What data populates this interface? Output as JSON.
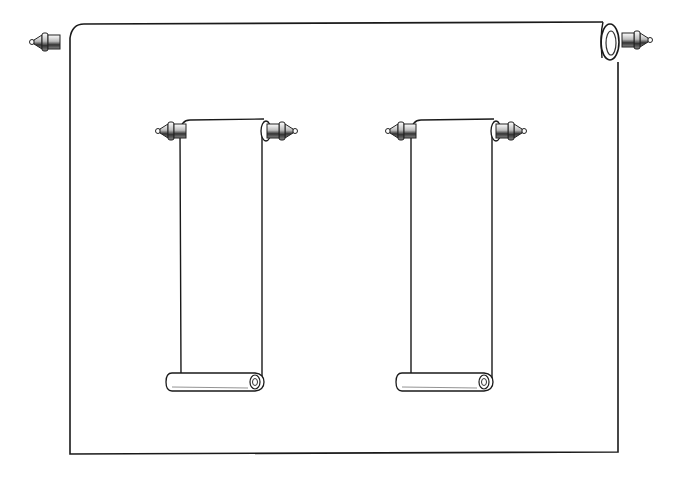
{
  "illustration": {
    "description": "Line-art engraving of a large hanging scroll with two smaller hanging scrolls inside",
    "colors": {
      "background": "#ffffff",
      "line": "#1a1a1a",
      "shade": "#555555"
    },
    "main_scroll": {
      "x": 70,
      "y": 24,
      "width": 548,
      "height": 430
    },
    "small_scrolls": [
      {
        "id": "left",
        "x": 180,
        "y": 120,
        "width": 80,
        "height": 262
      },
      {
        "id": "right",
        "x": 410,
        "y": 120,
        "width": 80,
        "height": 262
      }
    ]
  }
}
